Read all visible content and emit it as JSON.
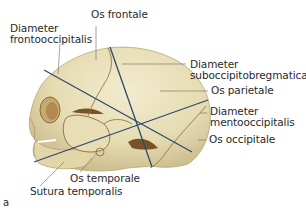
{
  "figure": {
    "panel_letter": "a",
    "colors": {
      "bone_light": "#eee6c4",
      "bone_mid": "#ddd2a4",
      "bone_shadow": "#a8946a",
      "suture": "#8a6a3a",
      "cavity": "#7a5228",
      "diameter_line": "#2e4a6a",
      "leader_line": "#6a6a6a",
      "text": "#2a2a2a"
    },
    "labels": {
      "os_frontale": "Os frontale",
      "diameter_frontooccipitalis": {
        "line1": "Diameter",
        "line2": "frontooccipitalis"
      },
      "diameter_suboccipitobregmatica": {
        "line1": "Diameter",
        "line2": "suboccipitobregmatica"
      },
      "os_parietale": "Os parietale",
      "diameter_mentooccipitalis": {
        "line1": "Diameter",
        "line2": "mentooccipitalis"
      },
      "os_occipitale": "Os occipitale",
      "os_temporale": "Os temporale",
      "sutura_temporalis": "Sutura temporalis"
    }
  }
}
